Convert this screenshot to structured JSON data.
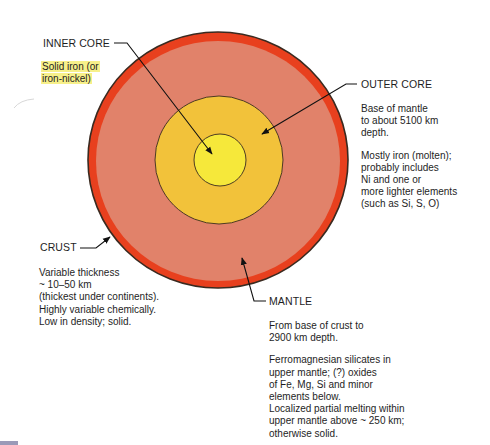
{
  "colors": {
    "crust": "#e8401e",
    "mantle": "#e1826a",
    "outer_core": "#f2c23a",
    "inner_core": "#f6e83a",
    "outline": "#3a2a20",
    "highlight": "#f7f08a"
  },
  "layers": {
    "inner_core": {
      "label": "INNER CORE",
      "description": [
        "Solid iron (or",
        "iron-nickel)"
      ]
    },
    "outer_core": {
      "label": "OUTER CORE",
      "description_paragraphs": [
        [
          "Base of mantle",
          "to about 5100 km",
          "depth."
        ],
        [
          "Mostly iron (molten);",
          "probably includes",
          "Ni and one or",
          "more lighter elements",
          "(such as Si, S, O)"
        ]
      ]
    },
    "crust": {
      "label": "CRUST",
      "description": [
        "Variable thickness",
        "~ 10–50 km",
        "(thickest under continents).",
        "Highly variable chemically.",
        "Low in density; solid."
      ]
    },
    "mantle": {
      "label": "MANTLE",
      "description_paragraphs": [
        [
          "From base of crust to",
          "2900 km depth."
        ],
        [
          "Ferromagnesian silicates in",
          "upper mantle; (?) oxides",
          "of Fe, Mg, Si and minor",
          "elements below.",
          "Localized partial melting within",
          "upper mantle above ~ 250 km;",
          "otherwise solid."
        ]
      ]
    }
  }
}
